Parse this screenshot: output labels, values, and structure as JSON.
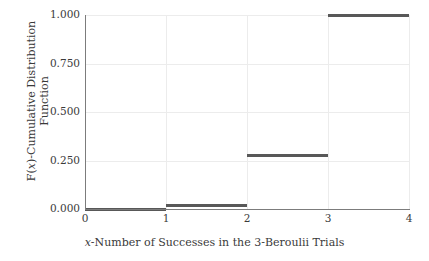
{
  "chart_data": {
    "type": "line",
    "subtype": "step-function",
    "title": "",
    "xlabel_prefix": "x",
    "xlabel_rest": "-Number of Successes in the 3-Beroulii Trials",
    "xlabel_full": "x-Number of Successes in the 3-Beroulii Trials",
    "ylabel_prefix": "F(x)",
    "ylabel_line1": "F(x)-Cumulative Distribution",
    "ylabel_line2": "Function",
    "ylabel_full": "F(x)-Cumulative Distribution Function",
    "xlim": [
      0,
      4
    ],
    "ylim": [
      0.0,
      1.0
    ],
    "xticks": [
      0,
      1,
      2,
      3,
      4
    ],
    "xtick_labels": [
      "0",
      "1",
      "2",
      "3",
      "4"
    ],
    "yticks": [
      0.0,
      0.25,
      0.5,
      0.75,
      1.0
    ],
    "ytick_labels": [
      "0.000",
      "0.250",
      "0.500",
      "0.750",
      "1.000"
    ],
    "grid": true,
    "legend": false,
    "line_color": "#585858",
    "grid_color": "#ececec",
    "axis_color": "#7c7c7c",
    "steps": [
      {
        "x_start": 0,
        "x_end": 1,
        "y": 0.0,
        "label": "0.000"
      },
      {
        "x_start": 1,
        "x_end": 2,
        "y": 0.016,
        "label": "0.016"
      },
      {
        "x_start": 2,
        "x_end": 3,
        "y": 0.278,
        "label": "0.278"
      },
      {
        "x_start": 3,
        "x_end": 4,
        "y": 1.0,
        "label": "1.000"
      }
    ],
    "categories": [
      "0-1",
      "1-2",
      "2-3",
      "3-4"
    ],
    "values": [
      0.0,
      0.016,
      0.278,
      1.0
    ]
  }
}
